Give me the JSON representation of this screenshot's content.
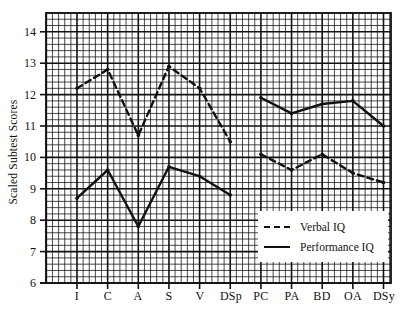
{
  "chart_data": {
    "type": "line",
    "title": "",
    "xlabel": "",
    "ylabel": "Scaled Subtest Scores",
    "ylim": [
      6,
      14.6
    ],
    "yticks": [
      6,
      7,
      8,
      9,
      10,
      11,
      12,
      13,
      14
    ],
    "grid": true,
    "legend_position": "lower right (inside plot)",
    "categories": [
      "I",
      "C",
      "A",
      "S",
      "V",
      "DSp",
      "PC",
      "PA",
      "BD",
      "OA",
      "DSy"
    ],
    "series": [
      {
        "name": "Verbal IQ",
        "style": "dashed",
        "segments": [
          {
            "categories": [
              "I",
              "C",
              "A",
              "S",
              "V",
              "DSp"
            ],
            "values": [
              12.2,
              12.8,
              10.7,
              12.9,
              12.2,
              10.5
            ]
          },
          {
            "categories": [
              "PC",
              "PA",
              "BD",
              "OA",
              "DSy"
            ],
            "values": [
              10.1,
              9.6,
              10.1,
              9.5,
              9.2
            ]
          }
        ]
      },
      {
        "name": "Performance IQ",
        "style": "solid",
        "segments": [
          {
            "categories": [
              "I",
              "C",
              "A",
              "S",
              "V",
              "DSp"
            ],
            "values": [
              8.7,
              9.6,
              7.8,
              9.7,
              9.4,
              8.8
            ]
          },
          {
            "categories": [
              "PC",
              "PA",
              "BD",
              "OA",
              "DSy"
            ],
            "values": [
              11.9,
              11.4,
              11.7,
              11.8,
              11.0
            ]
          }
        ]
      }
    ]
  },
  "axis": {
    "ylabel": "Scaled Subtest Scores",
    "yticks": [
      "14",
      "13",
      "12",
      "11",
      "10",
      "9",
      "8",
      "7",
      "6"
    ],
    "xticks": [
      "I",
      "C",
      "A",
      "S",
      "V",
      "DSp",
      "PC",
      "PA",
      "BD",
      "OA",
      "DSy"
    ]
  },
  "legend": {
    "verbal_label": "Verbal IQ",
    "performance_label": "Performance IQ"
  },
  "colors": {
    "ink": "#111111",
    "background": "#ffffff"
  }
}
